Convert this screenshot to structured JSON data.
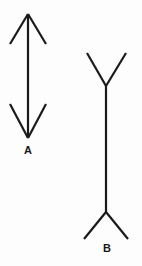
{
  "figure": {
    "background_color": "#fdfdfd",
    "stroke_color": "#1a1a1a",
    "labels": {
      "figure_a": "A",
      "figure_b": "B"
    }
  },
  "chart_data": {
    "type": "diagram",
    "xlabel": "",
    "ylabel": "",
    "grid": false,
    "legend": "none",
    "stroke_color": "#1a1a1a",
    "stroke_width": 2,
    "viewbox": [
      0,
      0,
      142,
      266
    ],
    "figures": [
      {
        "id": "A",
        "label": "A",
        "label_position": [
          28,
          154
        ],
        "shaft": {
          "x1": 28,
          "y1": 14,
          "x2": 28,
          "y2": 138
        },
        "shaft_length": 124,
        "fin_direction": "outward",
        "fins": [
          {
            "x1": 28,
            "y1": 14,
            "x2": 10,
            "y2": 44
          },
          {
            "x1": 28,
            "y1": 14,
            "x2": 46,
            "y2": 44
          },
          {
            "x1": 28,
            "y1": 138,
            "x2": 10,
            "y2": 104
          },
          {
            "x1": 28,
            "y1": 138,
            "x2": 46,
            "y2": 104
          }
        ]
      },
      {
        "id": "B",
        "label": "B",
        "label_position": [
          107,
          252
        ],
        "shaft": {
          "x1": 106,
          "y1": 86,
          "x2": 106,
          "y2": 212
        },
        "shaft_length": 126,
        "fin_direction": "inward",
        "fins": [
          {
            "x1": 106,
            "y1": 86,
            "x2": 87,
            "y2": 53
          },
          {
            "x1": 106,
            "y1": 86,
            "x2": 126,
            "y2": 53
          },
          {
            "x1": 106,
            "y1": 212,
            "x2": 84,
            "y2": 239
          },
          {
            "x1": 106,
            "y1": 212,
            "x2": 128,
            "y2": 239
          }
        ]
      }
    ]
  }
}
